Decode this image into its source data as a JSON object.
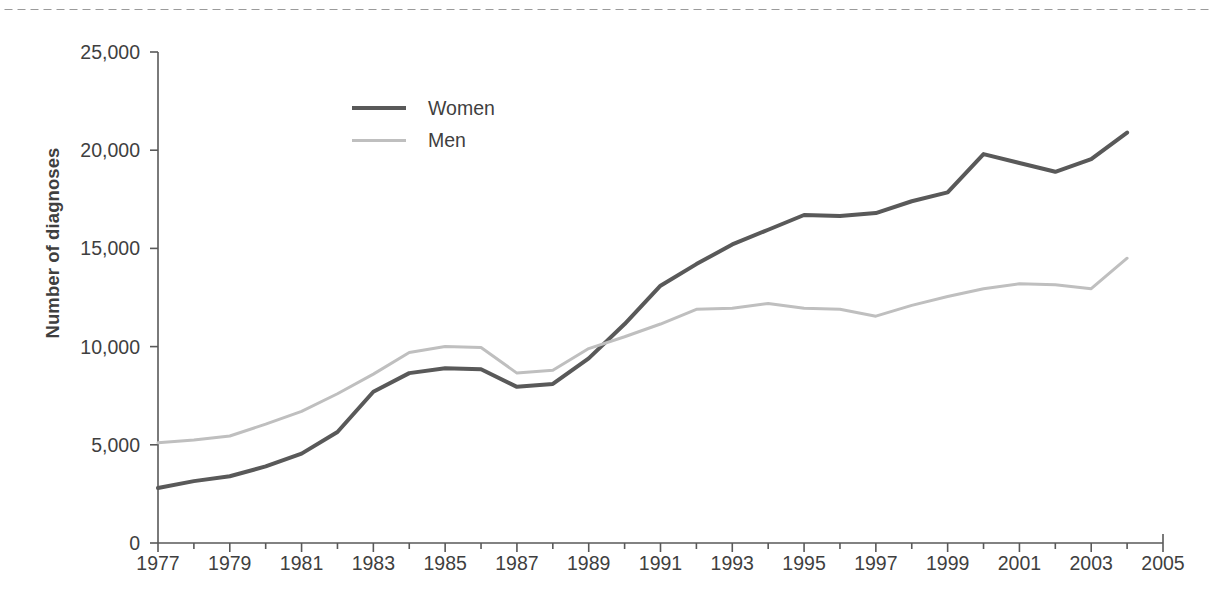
{
  "decor": {
    "top_rule": "dotted-rule"
  },
  "chart_data": {
    "type": "line",
    "title": "",
    "xlabel": "",
    "ylabel": "Number of diagnoses",
    "xlim": [
      1977,
      2005
    ],
    "ylim": [
      0,
      25000
    ],
    "xticks": [
      1977,
      1979,
      1981,
      1983,
      1985,
      1987,
      1989,
      1991,
      1993,
      1995,
      1997,
      1999,
      2001,
      2003,
      2005
    ],
    "xtick_labels": [
      "1977",
      "1979",
      "1981",
      "1983",
      "1985",
      "1987",
      "1989",
      "1991",
      "1993",
      "1995",
      "1997",
      "1999",
      "2001",
      "2003",
      "2005"
    ],
    "x_minor_tick_step": 1,
    "yticks": [
      0,
      5000,
      10000,
      15000,
      20000,
      25000
    ],
    "ytick_labels": [
      "0",
      "5,000",
      "10,000",
      "15,000",
      "20,000",
      "25,000"
    ],
    "grid": false,
    "legend_position": "upper-left-inside",
    "x": [
      1977,
      1978,
      1979,
      1980,
      1981,
      1982,
      1983,
      1984,
      1985,
      1986,
      1987,
      1988,
      1989,
      1990,
      1991,
      1992,
      1993,
      1994,
      1995,
      1996,
      1997,
      1998,
      1999,
      2000,
      2001,
      2002,
      2003,
      2004
    ],
    "series": [
      {
        "name": "Women",
        "color": "#595959",
        "width": 4,
        "values": [
          2800,
          3150,
          3400,
          3900,
          4550,
          5650,
          7700,
          8650,
          8900,
          8850,
          7950,
          8100,
          9400,
          11150,
          13100,
          14200,
          15200,
          15950,
          16700,
          16650,
          16800,
          17400,
          17850,
          19800,
          19350,
          18900,
          19550,
          20900
        ]
      },
      {
        "name": "Men",
        "color": "#bfbfbf",
        "width": 3,
        "values": [
          5100,
          5250,
          5450,
          6050,
          6700,
          7600,
          8600,
          9700,
          10000,
          9950,
          8650,
          8800,
          9900,
          10500,
          11150,
          11900,
          11950,
          12200,
          11950,
          11900,
          11550,
          12100,
          12550,
          12950,
          13200,
          13150,
          12950,
          14500
        ]
      }
    ]
  },
  "legend": {
    "items": [
      {
        "label": "Women",
        "swatch": "solid-dark-line"
      },
      {
        "label": "Men",
        "swatch": "solid-light-line"
      }
    ]
  }
}
